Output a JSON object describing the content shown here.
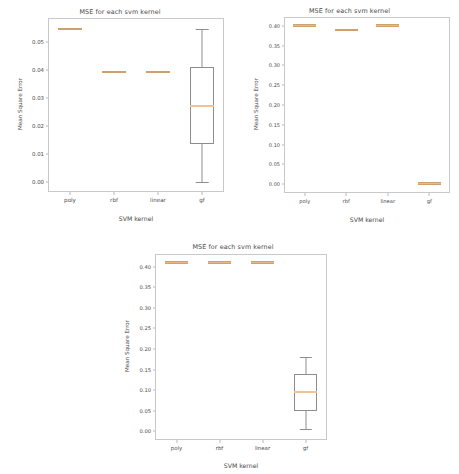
{
  "figures": [
    {
      "id": "fig1",
      "title": "MSE for each svm kernel",
      "xlabel": "SVM kernel",
      "ylabel": "Mean Square Error"
    },
    {
      "id": "fig2",
      "title": "MSE for each svm kernel",
      "xlabel": "SVM kernel",
      "ylabel": "Mean Square Error"
    },
    {
      "id": "fig3",
      "title": "MSE for each svm kernel",
      "xlabel": "SVM kernel",
      "ylabel": "Mean Square Error"
    }
  ],
  "chart_data": [
    {
      "type": "box",
      "title": "MSE for each svm kernel",
      "xlabel": "SVM kernel",
      "ylabel": "Mean Square Error",
      "categories": [
        "poly",
        "rbf",
        "linear",
        "gf"
      ],
      "ylim": [
        -0.0035,
        0.0585
      ],
      "yticks": [
        0.0,
        0.01,
        0.02,
        0.03,
        0.04,
        0.05
      ],
      "ytick_labels": [
        "0.00",
        "0.01",
        "0.02",
        "0.03",
        "0.04",
        "0.05"
      ],
      "grid": false,
      "legend": "none",
      "boxes": [
        {
          "category": "poly",
          "whisker_low": 0.0545,
          "q1": 0.0545,
          "median": 0.0545,
          "q3": 0.0545,
          "whisker_high": 0.0545,
          "degenerate": true
        },
        {
          "category": "rbf",
          "whisker_low": 0.0392,
          "q1": 0.0392,
          "median": 0.0392,
          "q3": 0.0392,
          "whisker_high": 0.0392,
          "degenerate": true
        },
        {
          "category": "linear",
          "whisker_low": 0.0392,
          "q1": 0.0392,
          "median": 0.0392,
          "q3": 0.0392,
          "whisker_high": 0.0392,
          "degenerate": true
        },
        {
          "category": "gf",
          "whisker_low": 0.0,
          "q1": 0.0135,
          "median": 0.0271,
          "q3": 0.041,
          "whisker_high": 0.0545,
          "degenerate": false
        }
      ]
    },
    {
      "type": "box",
      "title": "MSE for each svm kernel",
      "xlabel": "SVM kernel",
      "ylabel": "Mean Square Error",
      "categories": [
        "poly",
        "rbf",
        "linear",
        "gf"
      ],
      "ylim": [
        -0.022,
        0.422
      ],
      "yticks": [
        0.0,
        0.05,
        0.1,
        0.15,
        0.2,
        0.25,
        0.3,
        0.35,
        0.4
      ],
      "ytick_labels": [
        "0.00",
        "0.05",
        "0.10",
        "0.15",
        "0.20",
        "0.25",
        "0.30",
        "0.35",
        "0.40"
      ],
      "grid": false,
      "legend": "none",
      "boxes": [
        {
          "category": "poly",
          "whisker_low": 0.401,
          "q1": 0.401,
          "median": 0.401,
          "q3": 0.401,
          "whisker_high": 0.401,
          "degenerate": true
        },
        {
          "category": "rbf",
          "whisker_low": 0.389,
          "q1": 0.389,
          "median": 0.389,
          "q3": 0.389,
          "whisker_high": 0.389,
          "degenerate": true
        },
        {
          "category": "linear",
          "whisker_low": 0.401,
          "q1": 0.401,
          "median": 0.401,
          "q3": 0.401,
          "whisker_high": 0.401,
          "degenerate": true
        },
        {
          "category": "gf",
          "whisker_low": 0.002,
          "q1": 0.002,
          "median": 0.002,
          "q3": 0.002,
          "whisker_high": 0.002,
          "degenerate": true
        }
      ]
    },
    {
      "type": "box",
      "title": "MSE for each svm kernel",
      "xlabel": "SVM kernel",
      "ylabel": "Mean Square Error",
      "categories": [
        "poly",
        "rbf",
        "linear",
        "gf"
      ],
      "ylim": [
        -0.021,
        0.431
      ],
      "yticks": [
        0.0,
        0.05,
        0.1,
        0.15,
        0.2,
        0.25,
        0.3,
        0.35,
        0.4
      ],
      "ytick_labels": [
        "0.00",
        "0.05",
        "0.10",
        "0.15",
        "0.20",
        "0.25",
        "0.30",
        "0.35",
        "0.40"
      ],
      "grid": false,
      "legend": "none",
      "boxes": [
        {
          "category": "poly",
          "whisker_low": 0.41,
          "q1": 0.41,
          "median": 0.41,
          "q3": 0.41,
          "whisker_high": 0.41,
          "degenerate": true
        },
        {
          "category": "rbf",
          "whisker_low": 0.41,
          "q1": 0.41,
          "median": 0.41,
          "q3": 0.41,
          "whisker_high": 0.41,
          "degenerate": true
        },
        {
          "category": "linear",
          "whisker_low": 0.41,
          "q1": 0.41,
          "median": 0.41,
          "q3": 0.41,
          "whisker_high": 0.41,
          "degenerate": true
        },
        {
          "category": "gf",
          "whisker_low": 0.005,
          "q1": 0.05,
          "median": 0.096,
          "q3": 0.14,
          "whisker_high": 0.18,
          "degenerate": false
        }
      ]
    }
  ],
  "style": {
    "median_color": "#e9bb86",
    "box_edge_color": "#8d8d8d",
    "axis_color": "#c9c9c9",
    "text_color": "#4a4a4a",
    "background": "#ffffff"
  }
}
